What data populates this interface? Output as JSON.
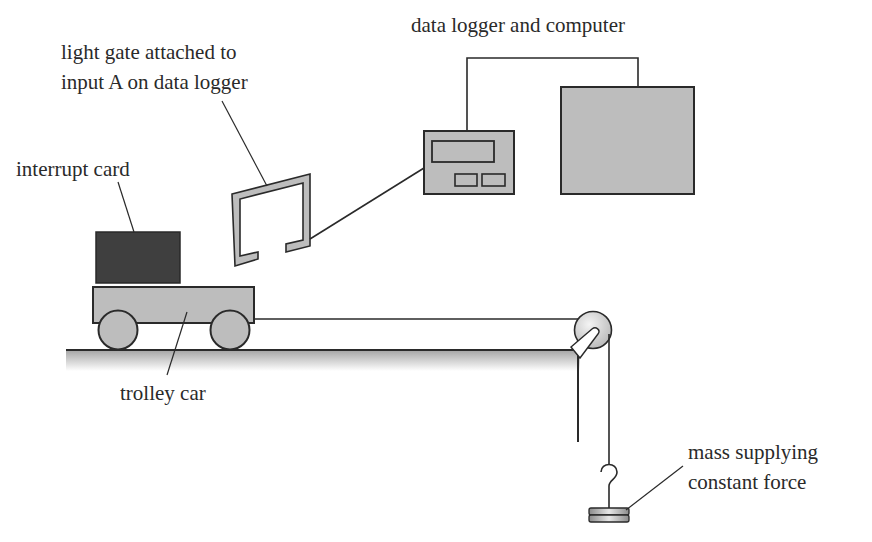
{
  "diagram": {
    "type": "physics-apparatus",
    "labels": {
      "data_logger_computer": "data logger and computer",
      "light_gate_line1": "light gate attached to",
      "light_gate_line2": "input A on data logger",
      "interrupt_card": "interrupt card",
      "trolley_car": "trolley car",
      "mass_line1": "mass supplying",
      "mass_line2": "constant force"
    },
    "components": [
      "interrupt card",
      "trolley car",
      "light gate",
      "data logger",
      "computer",
      "pulley",
      "string",
      "hanging mass",
      "bench"
    ],
    "colors": {
      "stroke": "#2a2a2a",
      "light_fill": "#bdbdbd",
      "dark_fill": "#3f3f3f",
      "background": "#ffffff"
    }
  }
}
